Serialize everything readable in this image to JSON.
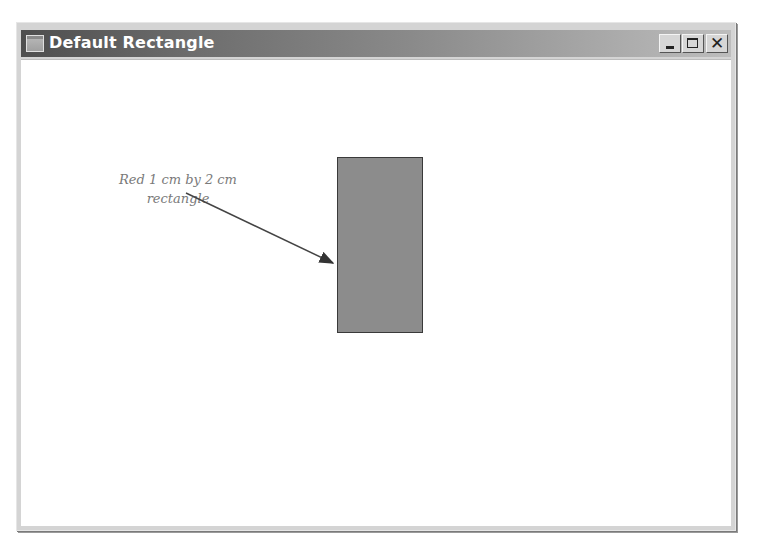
{
  "window": {
    "title": "Default Rectangle",
    "icon": "window-app-icon",
    "controls": {
      "minimize": "minimize-icon",
      "maximize": "maximize-icon",
      "close": "close-icon",
      "close_glyph": "✕"
    }
  },
  "canvas": {
    "annotation_line1": "Red 1 cm by 2 cm",
    "annotation_line2": "rectangle",
    "rectangle": {
      "width_cm": 1,
      "height_cm": 2,
      "fill": "#8c8c8c",
      "stroke": "#3a3a3a"
    },
    "arrow_color": "#333333"
  }
}
